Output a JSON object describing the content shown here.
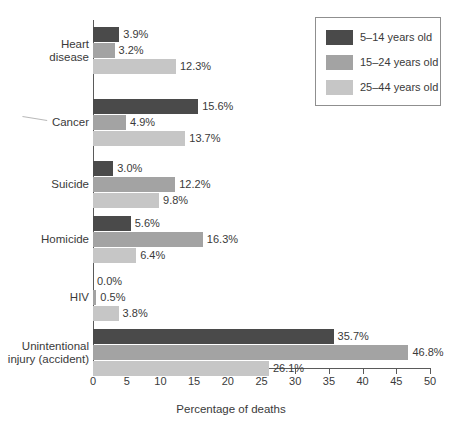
{
  "chart_data": {
    "type": "bar",
    "orientation": "horizontal",
    "title": "",
    "xlabel": "Percentage of deaths",
    "ylabel": "",
    "xlim": [
      0,
      50
    ],
    "xticks": [
      0,
      5,
      10,
      15,
      20,
      25,
      30,
      35,
      40,
      45,
      50
    ],
    "xtick_labels": [
      "0",
      "5",
      "10",
      "15",
      "20",
      "25",
      "30",
      "35",
      "40",
      "45",
      "50"
    ],
    "grid": false,
    "legend_position": "top-right",
    "value_format": "{v}%",
    "categories": [
      "Heart disease",
      "Cancer",
      "Suicide",
      "Homicide",
      "HIV",
      "Unintentional injury (accident)"
    ],
    "category_lines": [
      [
        "Heart",
        "disease"
      ],
      [
        "Cancer"
      ],
      [
        "Suicide"
      ],
      [
        "Homicide"
      ],
      [
        "HIV"
      ],
      [
        "Unintentional",
        "injury (accident)"
      ]
    ],
    "series": [
      {
        "name": "5–14 years old",
        "color": "#4a4a4a",
        "values": [
          3.9,
          15.6,
          3.0,
          5.6,
          0.0,
          35.7
        ],
        "labels": [
          "3.9%",
          "15.6%",
          "3.0%",
          "5.6%",
          "0.0%",
          "35.7%"
        ]
      },
      {
        "name": "15–24 years old",
        "color": "#a3a3a3",
        "values": [
          3.2,
          4.9,
          12.2,
          16.3,
          0.5,
          46.8
        ],
        "labels": [
          "3.2%",
          "4.9%",
          "12.2%",
          "16.3%",
          "0.5%",
          "46.8%"
        ]
      },
      {
        "name": "25–44 years old",
        "color": "#c6c6c6",
        "values": [
          12.3,
          13.7,
          9.8,
          6.4,
          3.8,
          26.1
        ],
        "labels": [
          "12.3%",
          "13.7%",
          "9.8%",
          "6.4%",
          "3.8%",
          "26.1%"
        ]
      }
    ]
  },
  "legend": {
    "entries": [
      {
        "label": "5–14 years old",
        "color": "#4a4a4a"
      },
      {
        "label": "15–24 years old",
        "color": "#a3a3a3"
      },
      {
        "label": "25–44 years old",
        "color": "#c6c6c6"
      }
    ]
  },
  "axis": {
    "x_title": "Percentage of deaths"
  },
  "caption": {
    "bottom_partial": ""
  },
  "colors": {
    "series_0": "#4a4a4a",
    "series_1": "#a3a3a3",
    "series_2": "#c6c6c6",
    "axis": "#5a5a5a",
    "text": "#3a3a3a",
    "background": "#ffffff"
  }
}
